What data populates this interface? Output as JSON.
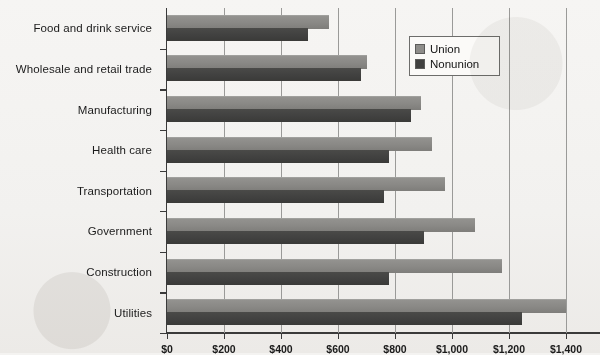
{
  "chart_data": {
    "type": "bar",
    "orientation": "horizontal",
    "title": "",
    "xlabel": "",
    "ylabel": "",
    "xlim": [
      0,
      1400
    ],
    "xticks": [
      0,
      200,
      400,
      600,
      800,
      1000,
      1200,
      1400
    ],
    "xtick_labels": [
      "$0",
      "$200",
      "$400",
      "$600",
      "$800",
      "$1,000",
      "$1,200",
      "$1,400"
    ],
    "grid": "vertical",
    "legend_position": "upper right",
    "categories": [
      "Food and drink service",
      "Wholesale and retail trade",
      "Manufacturing",
      "Health care",
      "Transportation",
      "Government",
      "Construction",
      "Utilities"
    ],
    "series": [
      {
        "name": "Union",
        "color": "#8e8d8a",
        "values": [
          570,
          700,
          890,
          930,
          975,
          1080,
          1175,
          1400
        ]
      },
      {
        "name": "Nonunion",
        "color": "#414140",
        "values": [
          495,
          680,
          855,
          780,
          760,
          900,
          780,
          1245
        ]
      }
    ]
  },
  "legend": {
    "items": [
      {
        "label": "Union",
        "swatch": "union"
      },
      {
        "label": "Nonunion",
        "swatch": "nonunion"
      }
    ]
  }
}
